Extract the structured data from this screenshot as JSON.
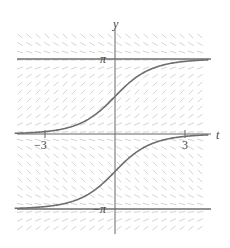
{
  "chart_data": {
    "type": "line",
    "title": "",
    "subtitle": "Slope field with solution curves",
    "xlabel": "t",
    "ylabel": "y",
    "x_ticks": [
      {
        "value": -3,
        "label": "−3"
      },
      {
        "value": 3,
        "label": "3"
      }
    ],
    "y_ticks": [
      {
        "value": 3.14159,
        "label": "π"
      },
      {
        "value": -3.14159,
        "label": "−π"
      }
    ],
    "xlim": [
      -4.3,
      4.0
    ],
    "ylim": [
      -3.9,
      4.0
    ],
    "grid": false,
    "legend": null,
    "slope_field": {
      "visible": true,
      "color": "#d4d4d4"
    },
    "series": [
      {
        "name": "equilibrium y = π",
        "kind": "horizontal",
        "y": 3.14159
      },
      {
        "name": "equilibrium y = 0",
        "kind": "horizontal",
        "y": 0
      },
      {
        "name": "equilibrium y = −π",
        "kind": "horizontal",
        "y": -3.14159
      },
      {
        "name": "solution through (0, π/2)",
        "x": [
          -4.3,
          -3,
          -2,
          -1,
          0,
          1,
          2,
          3,
          4
        ],
        "y": [
          0.03,
          0.1,
          0.27,
          0.71,
          1.57,
          2.43,
          2.87,
          3.04,
          3.11
        ]
      },
      {
        "name": "solution through (0, −π/2)",
        "x": [
          -4.3,
          -3,
          -2,
          -1,
          0,
          1,
          2,
          3,
          4
        ],
        "y": [
          -3.11,
          -3.04,
          -2.87,
          -2.43,
          -1.57,
          -0.71,
          -0.27,
          -0.1,
          -0.03
        ]
      }
    ],
    "colors": {
      "axis": "#666666",
      "curve": "#6e6e6e",
      "field": "#d4d4d4"
    }
  }
}
